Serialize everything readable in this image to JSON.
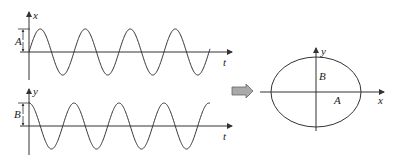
{
  "colors": {
    "stroke": "#333333",
    "arrow_fill": "#a9a9a9",
    "background": "#ffffff"
  },
  "plot_top": {
    "vertical_axis_label": "x",
    "horizontal_axis_label": "t",
    "amplitude_label": "A",
    "waveform": "sine"
  },
  "plot_bottom": {
    "vertical_axis_label": "y",
    "horizontal_axis_label": "t",
    "amplitude_label": "B",
    "waveform": "cosine"
  },
  "transform_arrow": {
    "icon": "right-arrow-icon"
  },
  "ellipse_plot": {
    "x_axis_label": "x",
    "y_axis_label": "y",
    "semi_major_label": "A",
    "semi_minor_label": "B"
  }
}
